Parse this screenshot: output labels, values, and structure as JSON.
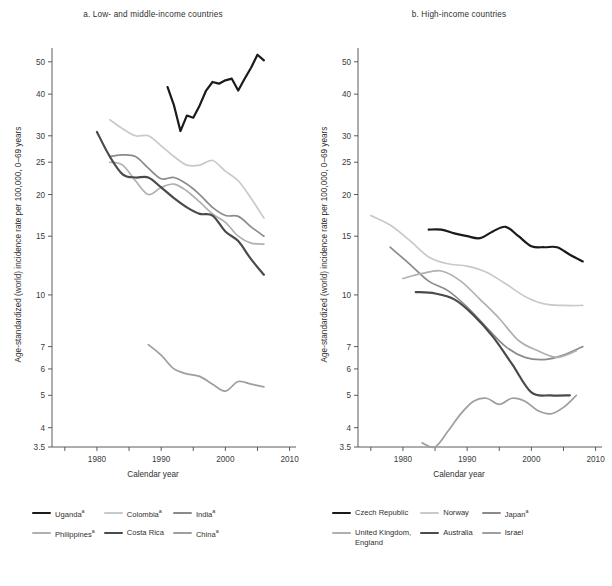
{
  "figure": {
    "y_axis_label": "Age-standardized (world) incidence rate per 100,000, 0–69 years",
    "x_axis_label": "Calendar year"
  },
  "panel_a": {
    "title": "a. Low- and middle-income countries",
    "legend": [
      {
        "label": "Uganda",
        "sup": "a",
        "color": "#1a1a1a",
        "width": 2.2
      },
      {
        "label": "Colombia",
        "sup": "a",
        "color": "#c9c9c9",
        "width": 1.7
      },
      {
        "label": "India",
        "sup": "a",
        "color": "#8b8b8b",
        "width": 1.7
      },
      {
        "label": "Philippines",
        "sup": "a",
        "color": "#b0b0b0",
        "width": 1.7
      },
      {
        "label": "Costa Rica",
        "sup": "",
        "color": "#4a4a4a",
        "width": 2.2
      },
      {
        "label": "China",
        "sup": "a",
        "color": "#9e9e9e",
        "width": 1.7
      }
    ]
  },
  "panel_b": {
    "title": "b. High-income countries",
    "legend": [
      {
        "label": "Czech Republic",
        "sup": "",
        "color": "#1a1a1a",
        "width": 2.2
      },
      {
        "label": "Norway",
        "sup": "",
        "color": "#c9c9c9",
        "width": 1.7
      },
      {
        "label": "Japan",
        "sup": "a",
        "color": "#8b8b8b",
        "width": 1.7
      },
      {
        "label": "United Kingdom,\nEngland",
        "sup": "",
        "color": "#b0b0b0",
        "width": 1.7
      },
      {
        "label": "Australia",
        "sup": "",
        "color": "#4a4a4a",
        "width": 2.2
      },
      {
        "label": "Israel",
        "sup": "",
        "color": "#9e9e9e",
        "width": 1.7
      }
    ]
  },
  "chart_data": [
    {
      "type": "line",
      "panel": "a",
      "title": "a. Low- and middle-income countries",
      "xlabel": "Calendar year",
      "ylabel": "Age-standardized (world) incidence rate per 100,000, 0–69 years",
      "yscale": "log",
      "ylim": [
        3.5,
        55
      ],
      "xlim": [
        1973,
        2011
      ],
      "ytick_labels": [
        "3.5",
        "4",
        "5",
        "6",
        "7",
        "10",
        "15",
        "20",
        "25",
        "30",
        "40",
        "50"
      ],
      "ytick_values": [
        3.5,
        4,
        5,
        6,
        7,
        10,
        15,
        20,
        25,
        30,
        40,
        50
      ],
      "xtick_labels": [
        "1980",
        "1990",
        "2000",
        "2010"
      ],
      "xtick_values": [
        1980,
        1990,
        2000,
        2010
      ],
      "xminor_ticks": [
        1975,
        1985,
        1995,
        2005
      ],
      "grid": false,
      "legend_position": "below",
      "series": [
        {
          "name": "Uganda",
          "color": "#1a1a1a",
          "width": 2.2,
          "x": [
            1991,
            1992,
            1993,
            1994,
            1995,
            1996,
            1997,
            1998,
            1999,
            2000,
            2001,
            2002,
            2003,
            2004,
            2005,
            2006
          ],
          "y": [
            42.0,
            37.0,
            31.0,
            34.5,
            34.0,
            37.0,
            41.0,
            43.5,
            43.0,
            44.0,
            44.5,
            41.0,
            44.5,
            48.0,
            52.5,
            50.5
          ]
        },
        {
          "name": "Colombia",
          "color": "#c9c9c9",
          "width": 1.7,
          "x": [
            1982,
            1984,
            1986,
            1988,
            1990,
            1992,
            1994,
            1996,
            1998,
            2000,
            2002,
            2004,
            2006
          ],
          "y": [
            33.5,
            31.5,
            30.0,
            30.0,
            28.0,
            26.0,
            24.5,
            24.5,
            25.3,
            23.5,
            22.0,
            19.5,
            17.0
          ]
        },
        {
          "name": "India",
          "color": "#8b8b8b",
          "width": 1.7,
          "x": [
            1982,
            1984,
            1986,
            1988,
            1990,
            1992,
            1994,
            1996,
            1998,
            2000,
            2002,
            2004,
            2006
          ],
          "y": [
            26.0,
            26.3,
            26.0,
            24.0,
            22.3,
            22.5,
            21.5,
            20.0,
            18.3,
            17.3,
            17.2,
            16.0,
            15.0
          ]
        },
        {
          "name": "Philippines",
          "color": "#b0b0b0",
          "width": 1.7,
          "x": [
            1982,
            1984,
            1986,
            1988,
            1990,
            1992,
            1994,
            1996,
            1998,
            2000,
            2002,
            2004,
            2006
          ],
          "y": [
            25.0,
            24.5,
            22.0,
            20.0,
            21.0,
            21.5,
            20.5,
            19.0,
            17.5,
            16.5,
            15.0,
            14.3,
            14.2
          ]
        },
        {
          "name": "Costa Rica",
          "color": "#4a4a4a",
          "width": 2.2,
          "x": [
            1980,
            1982,
            1984,
            1986,
            1988,
            1990,
            1992,
            1994,
            1996,
            1998,
            2000,
            2002,
            2004,
            2006
          ],
          "y": [
            30.8,
            26.0,
            23.0,
            22.5,
            22.5,
            21.0,
            19.5,
            18.3,
            17.5,
            17.3,
            15.5,
            14.5,
            12.8,
            11.5
          ]
        },
        {
          "name": "China",
          "color": "#9e9e9e",
          "width": 1.7,
          "x": [
            1988,
            1990,
            1992,
            1994,
            1996,
            1998,
            2000,
            2002,
            2004,
            2006
          ],
          "y": [
            7.1,
            6.6,
            6.0,
            5.8,
            5.7,
            5.4,
            5.15,
            5.5,
            5.4,
            5.3
          ]
        }
      ]
    },
    {
      "type": "line",
      "panel": "b",
      "title": "b. High-income countries",
      "xlabel": "Calendar year",
      "ylabel": "Age-standardized (world) incidence rate per 100,000, 0–69 years",
      "yscale": "log",
      "ylim": [
        3.5,
        55
      ],
      "xlim": [
        1973,
        2011
      ],
      "ytick_labels": [
        "3.5",
        "4",
        "5",
        "6",
        "7",
        "10",
        "15",
        "20",
        "25",
        "30",
        "40",
        "50"
      ],
      "ytick_values": [
        3.5,
        4,
        5,
        6,
        7,
        10,
        15,
        20,
        25,
        30,
        40,
        50
      ],
      "xtick_labels": [
        "1980",
        "1990",
        "2000",
        "2010"
      ],
      "xtick_values": [
        1980,
        1990,
        2000,
        2010
      ],
      "xminor_ticks": [
        1975,
        1985,
        1995,
        2005
      ],
      "grid": false,
      "legend_position": "below",
      "series": [
        {
          "name": "Czech Republic",
          "color": "#1a1a1a",
          "width": 2.2,
          "x": [
            1984,
            1986,
            1988,
            1990,
            1992,
            1994,
            1996,
            1998,
            2000,
            2002,
            2004,
            2006,
            2008
          ],
          "y": [
            15.7,
            15.7,
            15.3,
            15.0,
            14.8,
            15.5,
            16.0,
            15.0,
            14.0,
            13.9,
            13.9,
            13.2,
            12.6
          ]
        },
        {
          "name": "Norway",
          "color": "#c9c9c9",
          "width": 1.7,
          "x": [
            1975,
            1978,
            1981,
            1984,
            1987,
            1990,
            1993,
            1996,
            1999,
            2002,
            2005,
            2008
          ],
          "y": [
            17.3,
            16.2,
            14.6,
            13.0,
            12.4,
            12.2,
            11.7,
            10.8,
            9.9,
            9.4,
            9.3,
            9.3
          ]
        },
        {
          "name": "Japan",
          "color": "#8b8b8b",
          "width": 1.7,
          "x": [
            1978,
            1981,
            1984,
            1987,
            1990,
            1993,
            1996,
            1999,
            2002,
            2005,
            2008
          ],
          "y": [
            13.9,
            12.4,
            11.0,
            10.3,
            9.2,
            8.0,
            7.0,
            6.5,
            6.4,
            6.6,
            7.0
          ]
        },
        {
          "name": "United Kingdom, England",
          "color": "#b0b0b0",
          "width": 1.7,
          "x": [
            1980,
            1983,
            1986,
            1989,
            1992,
            1995,
            1998,
            2001,
            2004,
            2007
          ],
          "y": [
            11.2,
            11.6,
            11.8,
            11.0,
            9.7,
            8.5,
            7.3,
            6.8,
            6.5,
            6.8
          ]
        },
        {
          "name": "Australia",
          "color": "#4a4a4a",
          "width": 2.2,
          "x": [
            1982,
            1985,
            1988,
            1991,
            1994,
            1997,
            2000,
            2003,
            2006
          ],
          "y": [
            10.2,
            10.1,
            9.7,
            8.7,
            7.5,
            6.2,
            5.1,
            5.0,
            5.0
          ]
        },
        {
          "name": "Israel",
          "color": "#9e9e9e",
          "width": 1.7,
          "x": [
            1983,
            1985,
            1987,
            1989,
            1991,
            1993,
            1995,
            1997,
            1999,
            2001,
            2003,
            2005,
            2007
          ],
          "y": [
            3.6,
            3.5,
            3.9,
            4.4,
            4.8,
            4.9,
            4.7,
            4.9,
            4.8,
            4.5,
            4.4,
            4.6,
            5.0
          ]
        }
      ]
    }
  ]
}
